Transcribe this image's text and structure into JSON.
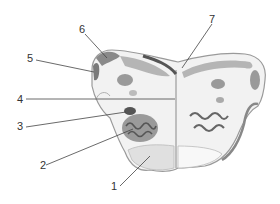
{
  "diagram": {
    "type": "anatomical cross-section (medulla oblongata, labeled)",
    "labels": [
      {
        "id": "1",
        "text": "1",
        "x": 116,
        "y": 191,
        "target": [
          135,
          168
        ]
      },
      {
        "id": "2",
        "text": "2",
        "x": 42,
        "y": 165,
        "target": [
          133,
          129
        ]
      },
      {
        "id": "3",
        "text": "3",
        "x": 18,
        "y": 127,
        "target": [
          125,
          112
        ]
      },
      {
        "id": "4",
        "text": "4",
        "x": 18,
        "y": 99,
        "target": [
          175,
          99
        ]
      },
      {
        "id": "5",
        "text": "5",
        "x": 27,
        "y": 59,
        "target": [
          94,
          71
        ]
      },
      {
        "id": "6",
        "text": "6",
        "x": 79,
        "y": 29,
        "target": [
          107,
          57
        ]
      },
      {
        "id": "7",
        "text": "7",
        "x": 213,
        "y": 19,
        "target": [
          182,
          69
        ]
      }
    ],
    "colors": {
      "tissue": "#f2f2f2",
      "outline": "#9a9a9a",
      "dark_region": "#7a7a7a",
      "mid_region": "#a8a8a8",
      "light_region": "#d6d6d6",
      "leader_line": "#444444",
      "label_text": "#333333"
    }
  }
}
